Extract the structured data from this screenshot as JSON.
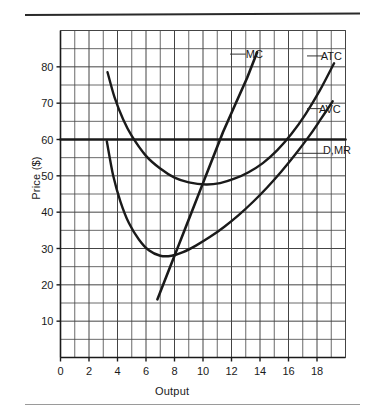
{
  "figure": {
    "top_rule": true,
    "bottom_rule": true
  },
  "chart_data": {
    "type": "line",
    "title": "",
    "xlabel": "Output",
    "ylabel": "Price ($)",
    "xlim": [
      0,
      20
    ],
    "ylim": [
      0,
      90
    ],
    "grid": true,
    "grid_step_x": 1,
    "grid_step_y": 5,
    "xticks": [
      0,
      2,
      4,
      6,
      8,
      10,
      12,
      14,
      16,
      18
    ],
    "xticklabels": [
      "0",
      "2",
      "4",
      "6",
      "8",
      "10",
      "12",
      "14",
      "16",
      "18"
    ],
    "yticks": [
      10,
      20,
      30,
      40,
      50,
      60,
      70,
      80
    ],
    "yticklabels": [
      "10",
      "20",
      "30",
      "40",
      "50",
      "60",
      "70",
      "80"
    ],
    "legend_position": "inline-curve-labels",
    "series": [
      {
        "name": "MC",
        "label": "MC",
        "label_xy": [
          13.6,
          83.5
        ],
        "leader_from": [
          13.0,
          83.5
        ],
        "leader_to": [
          11.9,
          83.5
        ],
        "kind": "line",
        "points": [
          [
            6.8,
            16
          ],
          [
            7.6,
            24
          ],
          [
            8.3,
            31
          ],
          [
            9.0,
            38
          ],
          [
            9.8,
            46
          ],
          [
            10.6,
            54
          ],
          [
            11.4,
            62
          ],
          [
            12.3,
            70
          ],
          [
            13.1,
            77
          ],
          [
            13.8,
            84
          ]
        ]
      },
      {
        "name": "ATC",
        "label": "ATC",
        "label_xy": [
          19.0,
          83.0
        ],
        "leader_from": [
          18.4,
          83.0
        ],
        "leader_to": [
          17.3,
          83.0
        ],
        "kind": "u-curve",
        "points": [
          [
            3.3,
            78.5
          ],
          [
            3.8,
            71.5
          ],
          [
            4.4,
            65.5
          ],
          [
            5.0,
            61.0
          ],
          [
            6.0,
            55.5
          ],
          [
            7.0,
            52.0
          ],
          [
            8.0,
            49.5
          ],
          [
            9.0,
            48.2
          ],
          [
            10.2,
            47.6
          ],
          [
            11.2,
            48.0
          ],
          [
            12.2,
            49.2
          ],
          [
            13.2,
            51.0
          ],
          [
            14.2,
            53.5
          ],
          [
            15.2,
            57.0
          ],
          [
            16.2,
            61.5
          ],
          [
            17.2,
            67.0
          ],
          [
            18.2,
            73.5
          ],
          [
            19.2,
            81.0
          ]
        ]
      },
      {
        "name": "AVC",
        "label": "AVC",
        "label_xy": [
          18.9,
          68.5
        ],
        "leader_from": [
          18.3,
          68.5
        ],
        "leader_to": [
          17.3,
          68.5
        ],
        "kind": "u-curve",
        "points": [
          [
            3.25,
            59.5
          ],
          [
            3.7,
            50.0
          ],
          [
            4.2,
            43.0
          ],
          [
            4.8,
            37.0
          ],
          [
            5.5,
            32.5
          ],
          [
            6.2,
            29.5
          ],
          [
            7.0,
            28.0
          ],
          [
            7.8,
            28.0
          ],
          [
            8.6,
            29.0
          ],
          [
            9.5,
            30.8
          ],
          [
            10.5,
            33.2
          ],
          [
            11.5,
            36.0
          ],
          [
            12.5,
            39.2
          ],
          [
            13.5,
            42.8
          ],
          [
            14.5,
            46.8
          ],
          [
            15.5,
            51.2
          ],
          [
            16.5,
            56.0
          ],
          [
            17.5,
            61.2
          ],
          [
            18.3,
            65.8
          ],
          [
            19.1,
            70.5
          ]
        ]
      },
      {
        "name": "D,MR",
        "label": "D,MR",
        "label_xy": [
          19.4,
          57.0
        ],
        "leader_from": [
          18.5,
          56.2
        ],
        "leader_to": [
          16.6,
          56.2
        ],
        "kind": "horizontal",
        "y_value": 60,
        "points": [
          [
            0.0,
            60
          ],
          [
            20.0,
            60
          ]
        ]
      }
    ]
  }
}
